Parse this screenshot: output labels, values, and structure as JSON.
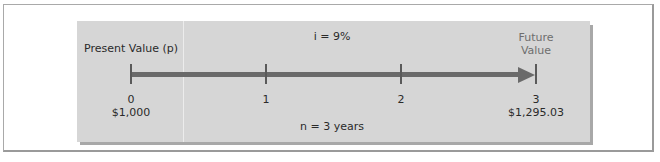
{
  "diagram": {
    "type": "timeline",
    "start_label": "Present Value (p)",
    "end_label_line1": "Future",
    "end_label_line2": "Value",
    "rate_label": "i = 9%",
    "period_label": "n = 3 years",
    "ticks": [
      {
        "period": "0",
        "value": "$1,000"
      },
      {
        "period": "1",
        "value": ""
      },
      {
        "period": "2",
        "value": ""
      },
      {
        "period": "3",
        "value": "$1,295.03"
      }
    ],
    "colors": {
      "panel": "#d6d6d6",
      "axis": "#6a6a6a",
      "text": "#2a2a2a",
      "muted_text": "#6e6e6e"
    }
  }
}
